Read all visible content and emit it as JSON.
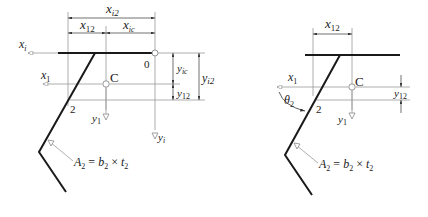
{
  "diagrams": [
    {
      "id": "left",
      "labels": {
        "x_i2": {
          "base": "x",
          "sub": "i2"
        },
        "x_12": {
          "base": "x",
          "sub": "12"
        },
        "x_ic": {
          "base": "x",
          "sub": "ic"
        },
        "x_i": {
          "base": "x",
          "sub": "i"
        },
        "x_1": {
          "base": "x",
          "sub": "1"
        },
        "origin": "0",
        "centroid": "C",
        "point2": "2",
        "y_ic": {
          "base": "y",
          "sub": "ic"
        },
        "y_12": {
          "base": "y",
          "sub": "12"
        },
        "y_i2": {
          "base": "y",
          "sub": "i2"
        },
        "y_1": {
          "base": "y",
          "sub": "1"
        },
        "y_i": {
          "base": "y",
          "sub": "i"
        },
        "area": {
          "A": "A",
          "A_sub": "2",
          "eq": " = ",
          "b": "b",
          "b_sub": "2",
          "times": " × ",
          "t": "t",
          "t_sub": "2"
        }
      }
    },
    {
      "id": "right",
      "labels": {
        "x_12": {
          "base": "x",
          "sub": "12"
        },
        "x_1": {
          "base": "x",
          "sub": "1"
        },
        "centroid": "C",
        "point2": "2",
        "theta": {
          "base": "θ",
          "sub": "2"
        },
        "y_12": {
          "base": "y",
          "sub": "12"
        },
        "y_1": {
          "base": "y",
          "sub": "1"
        },
        "area": {
          "A": "A",
          "A_sub": "2",
          "eq": " = ",
          "b": "b",
          "b_sub": "2",
          "times": " × ",
          "t": "t",
          "t_sub": "2"
        }
      }
    }
  ],
  "colors": {
    "member": "#1a1a1a",
    "reference": "#9a9a9a",
    "text": "#222222"
  }
}
